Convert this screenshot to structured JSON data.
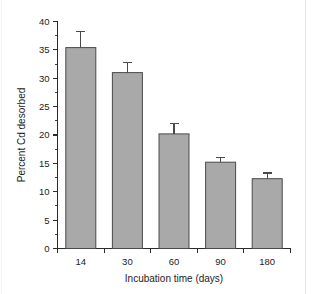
{
  "chart_data": {
    "type": "bar",
    "title": "",
    "subtitle": "",
    "xlabel": "Incubation time (days)",
    "ylabel": "Percent Cd desorbed",
    "categories": [
      "14",
      "30",
      "60",
      "90",
      "180"
    ],
    "values": [
      35.4,
      31.0,
      20.2,
      15.2,
      12.3
    ],
    "errors": [
      2.8,
      1.8,
      1.9,
      0.8,
      1.0
    ],
    "ylim": [
      0,
      40
    ],
    "ytick_labels": [
      "0",
      "5",
      "10",
      "15",
      "20",
      "25",
      "30",
      "35",
      "40"
    ],
    "ytick_values": [
      0,
      5,
      10,
      15,
      20,
      25,
      30,
      35,
      40
    ],
    "yminor_interval": 2.5,
    "grid": false,
    "legend": null,
    "legend_position": "none",
    "bar_color": "#a9a9a9",
    "bar_edge_color": "#4a4a4a",
    "axis_color": "#2b2b2b",
    "background_color": "#ffffff",
    "annotations": []
  },
  "figure": {
    "y_axis_title": "Percent Cd desorbed",
    "x_axis_title": "Incubation time (days)"
  }
}
